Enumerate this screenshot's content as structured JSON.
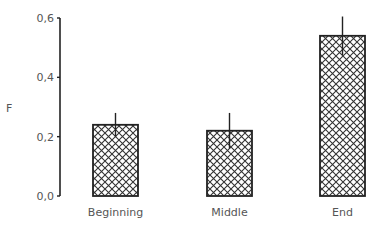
{
  "chart_data": {
    "type": "bar",
    "title": "",
    "xlabel": "",
    "ylabel": "F",
    "ylim": [
      0.0,
      0.6
    ],
    "yticks": [
      "0,0",
      "0,2",
      "0,4",
      "0,6"
    ],
    "categories": [
      "Beginning",
      "Middle",
      "End"
    ],
    "values": [
      0.24,
      0.22,
      0.54
    ],
    "error": [
      0.04,
      0.06,
      0.065
    ],
    "grid": false,
    "legend": null,
    "fill_pattern": "crosshatch",
    "colors": {
      "bar_edge": "#222222",
      "hatch": "#333333",
      "axis": "#222222",
      "text": "#555555"
    }
  }
}
